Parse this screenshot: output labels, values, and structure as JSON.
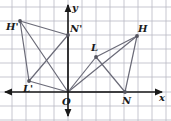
{
  "figure": {
    "background_color": "#ffffff",
    "grid_color": "#b9b9c4",
    "axis_color": "#1a1a1a",
    "segment_color": "#6b6b78",
    "point_color": "#55555f",
    "grid_spacing_px": 14,
    "origin_px": {
      "x": 68,
      "y": 92
    }
  },
  "axes": {
    "x_label": "x",
    "y_label": "y",
    "origin_label": "O",
    "x_axis_y_px": 92,
    "y_axis_x_px": 68,
    "x_arrow_left": true,
    "x_arrow_right": true,
    "y_arrow_up": true,
    "y_arrow_down": true
  },
  "points": [
    {
      "name": "H",
      "label": "H",
      "px": {
        "x": 137,
        "y": 36
      },
      "grid": {
        "x": 5,
        "y": 4
      },
      "label_px": {
        "x": 138,
        "y": 24
      }
    },
    {
      "name": "L",
      "label": "L",
      "px": {
        "x": 96,
        "y": 57
      },
      "grid": {
        "x": 2,
        "y": 2.5
      },
      "label_px": {
        "x": 91,
        "y": 43
      }
    },
    {
      "name": "N",
      "label": "N",
      "px": {
        "x": 125,
        "y": 92
      },
      "grid": {
        "x": 4,
        "y": 0
      },
      "label_px": {
        "x": 122,
        "y": 96
      }
    },
    {
      "name": "Hp",
      "label": "H'",
      "px": {
        "x": 20,
        "y": 21
      },
      "grid": {
        "x": -3.5,
        "y": 5
      },
      "label_px": {
        "x": 6,
        "y": 22
      }
    },
    {
      "name": "Np",
      "label": "N'",
      "px": {
        "x": 68,
        "y": 35
      },
      "grid": {
        "x": 0,
        "y": 4
      },
      "label_px": {
        "x": 70,
        "y": 24
      }
    },
    {
      "name": "Lp",
      "label": "L'",
      "px": {
        "x": 29,
        "y": 81
      },
      "grid": {
        "x": -2.8,
        "y": 0.8
      },
      "label_px": {
        "x": 23,
        "y": 84
      }
    },
    {
      "name": "O",
      "label": "O",
      "px": {
        "x": 68,
        "y": 92
      },
      "grid": {
        "x": 0,
        "y": 0
      },
      "label_px": {
        "x": 62,
        "y": 97
      }
    }
  ],
  "segments": [
    {
      "from": "Hp",
      "to": "Np"
    },
    {
      "from": "Np",
      "to": "O"
    },
    {
      "from": "Hp",
      "to": "O"
    },
    {
      "from": "Hp",
      "to": "Lp"
    },
    {
      "from": "Lp",
      "to": "O"
    },
    {
      "from": "Lp",
      "to": "Np"
    },
    {
      "from": "L",
      "to": "H"
    },
    {
      "from": "H",
      "to": "N"
    },
    {
      "from": "L",
      "to": "O"
    },
    {
      "from": "O",
      "to": "N"
    },
    {
      "from": "O",
      "to": "H"
    },
    {
      "from": "L",
      "to": "N"
    }
  ],
  "grid_lines": {
    "vertical_px": [
      12,
      26,
      40,
      54,
      68,
      82,
      96,
      110,
      124,
      138,
      152,
      166
    ],
    "horizontal_px": [
      7,
      21,
      35,
      49,
      63,
      77,
      92,
      106,
      120
    ]
  }
}
